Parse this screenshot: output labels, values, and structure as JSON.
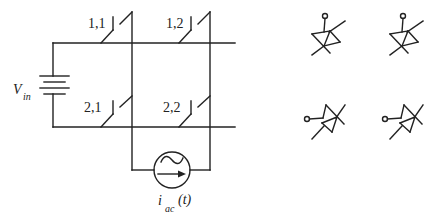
{
  "diagram": {
    "type": "circuit-schematic",
    "line_color": "#222222",
    "background": "#ffffff",
    "source": {
      "voltage_label": "V",
      "voltage_subscript": "in"
    },
    "current_source": {
      "label": "i",
      "label_subscript": "ac",
      "label_suffix": "(t)"
    },
    "switches": [
      {
        "id": "1,1",
        "label": "1,1",
        "row": 1,
        "col": 1
      },
      {
        "id": "1,2",
        "label": "1,2",
        "row": 1,
        "col": 2
      },
      {
        "id": "2,1",
        "label": "2,1",
        "row": 2,
        "col": 1
      },
      {
        "id": "2,2",
        "label": "2,2",
        "row": 2,
        "col": 2
      }
    ],
    "switch_symbols": [
      {
        "id": "symbol-a",
        "orientation": "terminal-top"
      },
      {
        "id": "symbol-b",
        "orientation": "terminal-top"
      },
      {
        "id": "symbol-c",
        "orientation": "terminal-left"
      },
      {
        "id": "symbol-d",
        "orientation": "terminal-left"
      }
    ]
  }
}
